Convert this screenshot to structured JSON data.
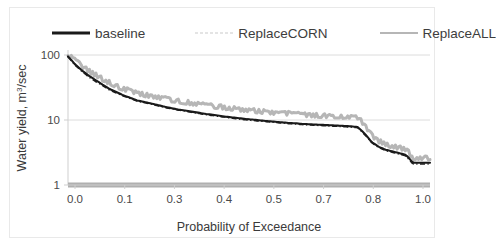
{
  "legend": {
    "position": "top",
    "entries": [
      {
        "label": "baseline",
        "style": "solid-black",
        "color": "#1a1a1a"
      },
      {
        "label": "ReplaceCORN",
        "style": "dash-dot",
        "color": "#1f1f1f"
      },
      {
        "label": "ReplaceALL",
        "style": "solid-gray",
        "color": "#b6b6b6"
      }
    ]
  },
  "axes": {
    "x": {
      "title": "Probability of Exceedance",
      "ticks": [
        "0.0",
        "0.1",
        "0.3",
        "0.4",
        "0.5",
        "0.7",
        "0.8",
        "1.0"
      ],
      "min": 0,
      "max": 1.05
    },
    "y": {
      "title_main": "Water yield, m",
      "title_sup": "3",
      "title_tail": "/sec",
      "ticks": [
        "100",
        "10",
        "1"
      ],
      "scale": "log",
      "min": 1,
      "max": 100
    }
  },
  "chart_data": {
    "type": "line",
    "title": "",
    "xlabel": "Probability of Exceedance",
    "ylabel": "Water yield, m3/sec",
    "yscale": "log",
    "ylim": [
      1,
      100
    ],
    "xlim": [
      0,
      1.05
    ],
    "grid": "horizontal",
    "legend_position": "top",
    "x": [
      0.0,
      0.02,
      0.04,
      0.06,
      0.08,
      0.1,
      0.12,
      0.14,
      0.16,
      0.18,
      0.2,
      0.22,
      0.24,
      0.26,
      0.28,
      0.3,
      0.32,
      0.34,
      0.36,
      0.38,
      0.4,
      0.42,
      0.44,
      0.46,
      0.48,
      0.5,
      0.52,
      0.54,
      0.56,
      0.58,
      0.6,
      0.62,
      0.64,
      0.66,
      0.68,
      0.7,
      0.72,
      0.74,
      0.76,
      0.78,
      0.8,
      0.82,
      0.84,
      0.86,
      0.88,
      0.9,
      0.92,
      0.94,
      0.96,
      0.98,
      1.0
    ],
    "series": [
      {
        "name": "baseline",
        "style": "solid",
        "color": "#1a1a1a",
        "values": [
          95,
          72,
          58,
          48,
          41,
          35,
          30,
          27,
          24,
          22,
          20,
          19,
          18,
          17,
          16,
          15.2,
          14.5,
          14,
          13.4,
          12.9,
          12.4,
          12,
          11.6,
          11.2,
          10.9,
          10.6,
          10.3,
          10.1,
          9.8,
          9.6,
          9.4,
          9.2,
          9.0,
          8.9,
          8.7,
          8.6,
          8.5,
          8.4,
          8.3,
          8.2,
          8.1,
          8.0,
          7.8,
          6.2,
          4.6,
          3.9,
          3.5,
          3.3,
          3.1,
          2.9,
          2.2
        ]
      },
      {
        "name": "ReplaceCORN",
        "style": "dash-dot",
        "color": "#1f1f1f",
        "values": [
          93,
          70,
          56,
          46,
          39,
          34,
          29,
          26,
          23.5,
          21.5,
          19.6,
          18.6,
          17.6,
          16.6,
          15.6,
          14.9,
          14.2,
          13.7,
          13.1,
          12.6,
          12.1,
          11.7,
          11.3,
          11.0,
          10.6,
          10.3,
          10.0,
          9.8,
          9.6,
          9.4,
          9.2,
          9.0,
          8.8,
          8.7,
          8.5,
          8.4,
          8.3,
          8.2,
          8.1,
          8.0,
          7.9,
          7.8,
          7.6,
          6.0,
          4.5,
          3.8,
          3.4,
          3.2,
          3.0,
          2.8,
          2.1
        ]
      },
      {
        "name": "ReplaceALL",
        "style": "solid-noisy",
        "color": "#b6b6b6",
        "values": [
          100,
          80,
          65,
          55,
          47,
          41,
          36,
          32,
          29,
          27,
          25,
          23.5,
          22.5,
          21.5,
          20.5,
          19.5,
          18.8,
          18.1,
          17.5,
          16.9,
          16.3,
          15.8,
          15.3,
          14.8,
          14.4,
          14.0,
          13.6,
          13.3,
          13.0,
          12.7,
          12.4,
          12.2,
          12.0,
          11.8,
          11.6,
          11.4,
          11.3,
          11.2,
          11.1,
          11.0,
          10.9,
          10.8,
          10.5,
          8.0,
          5.6,
          4.6,
          4.1,
          3.8,
          3.6,
          3.4,
          2.5
        ]
      },
      {
        "name": "ReplaceALL-floor",
        "style": "flat-band",
        "color": "#b0b0b0",
        "values": [
          1,
          1,
          1,
          1,
          1,
          1,
          1,
          1,
          1,
          1,
          1,
          1,
          1,
          1,
          1,
          1,
          1,
          1,
          1,
          1,
          1,
          1,
          1,
          1,
          1,
          1,
          1,
          1,
          1,
          1,
          1,
          1,
          1,
          1,
          1,
          1,
          1,
          1,
          1,
          1,
          1,
          1,
          1,
          1,
          1,
          1,
          1,
          1,
          1,
          1,
          1
        ]
      }
    ]
  }
}
